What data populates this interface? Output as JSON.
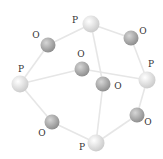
{
  "diagram": {
    "type": "molecular-structure",
    "colors": {
      "background": "#ffffff",
      "bond": "#e6e6e6",
      "phosphorus_light": "#ffffff",
      "phosphorus_dark": "#c8c8c8",
      "oxygen_light": "#d6d6d6",
      "oxygen_dark": "#8a8a8a",
      "label": "#333333"
    },
    "atoms": [
      {
        "id": "P1",
        "element": "P",
        "label": "P",
        "x": 91,
        "y": 24,
        "r": 8.5,
        "lx": 75,
        "ly": 20
      },
      {
        "id": "O1",
        "element": "O",
        "label": "O",
        "x": 48,
        "y": 45,
        "r": 7.5,
        "lx": 36,
        "ly": 35
      },
      {
        "id": "O2",
        "element": "O",
        "label": "O",
        "x": 131,
        "y": 38,
        "r": 7.5,
        "lx": 143,
        "ly": 31
      },
      {
        "id": "P2",
        "element": "P",
        "label": "P",
        "x": 20,
        "y": 84,
        "r": 8.5,
        "lx": 21,
        "ly": 69
      },
      {
        "id": "O3",
        "element": "O",
        "label": "O",
        "x": 82,
        "y": 69,
        "r": 7.5,
        "lx": 81,
        "ly": 54
      },
      {
        "id": "P3",
        "element": "P",
        "label": "P",
        "x": 147,
        "y": 80,
        "r": 8.5,
        "lx": 151,
        "ly": 64
      },
      {
        "id": "O4",
        "element": "O",
        "label": "O",
        "x": 103,
        "y": 84,
        "r": 7.5,
        "lx": 118,
        "ly": 86
      },
      {
        "id": "O5",
        "element": "O",
        "label": "O",
        "x": 52,
        "y": 122,
        "r": 7.5,
        "lx": 42,
        "ly": 133
      },
      {
        "id": "O6",
        "element": "O",
        "label": "O",
        "x": 137,
        "y": 115,
        "r": 7.5,
        "lx": 148,
        "ly": 122
      },
      {
        "id": "P4",
        "element": "P",
        "label": "P",
        "x": 96,
        "y": 143,
        "r": 8.5,
        "lx": 82,
        "ly": 147
      }
    ],
    "bonds": [
      [
        "P1",
        "O1"
      ],
      [
        "P1",
        "O2"
      ],
      [
        "P1",
        "O4"
      ],
      [
        "P2",
        "O1"
      ],
      [
        "P2",
        "O3"
      ],
      [
        "P2",
        "O5"
      ],
      [
        "P3",
        "O2"
      ],
      [
        "P3",
        "O3"
      ],
      [
        "P3",
        "O6"
      ],
      [
        "P4",
        "O4"
      ],
      [
        "P4",
        "O5"
      ],
      [
        "P4",
        "O6"
      ]
    ]
  }
}
